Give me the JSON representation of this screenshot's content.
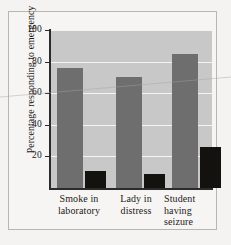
{
  "chart_data": {
    "type": "bar",
    "title": "",
    "xlabel": "",
    "ylabel": "Percentage responding to emergency",
    "ylim": [
      0,
      100
    ],
    "yticks": [
      20,
      40,
      60,
      80,
      100
    ],
    "ytick_labels": [
      "20",
      "40",
      "60",
      "80",
      "100"
    ],
    "grid": true,
    "legend": "none",
    "categories": [
      "Smoke in laboratory",
      "Lady in distress",
      "Student having seizure"
    ],
    "category_lines": [
      [
        "Smoke in",
        "laboratory"
      ],
      [
        "Lady in",
        "distress"
      ],
      [
        "Student",
        "having",
        "seizure"
      ]
    ],
    "series": [
      {
        "name": "Alone",
        "color": "#6e6e6e",
        "values": [
          76,
          70,
          85
        ]
      },
      {
        "name": "In group",
        "color": "#14120f",
        "values": [
          11,
          9,
          26
        ]
      }
    ]
  },
  "colors": {
    "plot_background": "#c8c8c8",
    "page_background": "#f4f3f1",
    "gridline": "#f4f4f2",
    "axis": "#2b2b2b",
    "bar_gray": "#6e6e6e",
    "bar_black": "#14120f",
    "text": "#1d1b19",
    "frame_border": "#b9b6b2"
  }
}
